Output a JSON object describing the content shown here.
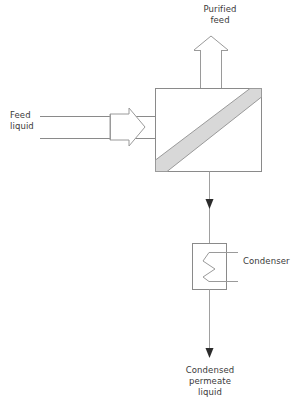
{
  "diagram": {
    "background_color": "#ffffff",
    "line_color": "#8a8a8a",
    "membrane_fill_color": "#d8d8d8",
    "membrane_edge_color": "#9a9a9a",
    "arrowhead_color": "#2b2b2b",
    "text_color": "#3a3a3a",
    "labels": {
      "purified_feed": "Purified\nfeed",
      "feed_liquid": "Feed\nliquid",
      "condenser": "Condenser",
      "condensed_permeate_liquid": "Condensed\npermeate\nliquid"
    },
    "nodes": {
      "membrane_module": {
        "name": "membrane-module",
        "shape": "rectangle",
        "x": 155,
        "y": 88,
        "width": 107,
        "height": 84,
        "internal_element": "diagonal membrane band"
      },
      "condenser_unit": {
        "name": "condenser",
        "shape": "rectangle-with-coil",
        "x": 192,
        "y": 243,
        "width": 35,
        "height": 47,
        "internal_element": "zigzag cooling coil"
      },
      "feed_pump": {
        "name": "feed-pump",
        "shape": "hollow-arrow-right",
        "x": 108,
        "y": 114,
        "width": 36,
        "height": 26
      },
      "purified_feed_arrow": {
        "name": "purified-feed-outlet-arrow",
        "shape": "hollow-arrow-up",
        "x": 200,
        "y": 38,
        "width": 22,
        "height": 50
      }
    },
    "streams": [
      {
        "name": "feed-liquid-upper-line",
        "from_x": 40,
        "from_y": 116,
        "to_x": 155,
        "to_y": 116
      },
      {
        "name": "feed-liquid-lower-line",
        "from_x": 40,
        "from_y": 138,
        "to_x": 155,
        "to_y": 138
      },
      {
        "name": "permeate-vapour-line",
        "from_x": 209,
        "from_y": 172,
        "to_x": 209,
        "to_y": 243,
        "arrow": "down"
      },
      {
        "name": "condensed-permeate-line",
        "from_x": 209,
        "from_y": 290,
        "to_x": 209,
        "to_y": 357,
        "arrow": "down"
      },
      {
        "name": "condenser-coolant-top",
        "from_x": 209,
        "from_y": 252,
        "to_x": 238,
        "to_y": 252
      },
      {
        "name": "condenser-coolant-bottom",
        "from_x": 209,
        "from_y": 281,
        "to_x": 238,
        "to_y": 281
      }
    ]
  }
}
